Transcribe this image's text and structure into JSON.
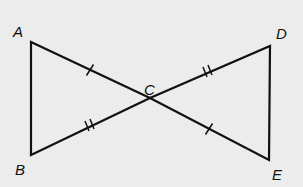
{
  "points": {
    "A": {
      "label": "A",
      "x": 31,
      "y": 42
    },
    "B": {
      "label": "B",
      "x": 31,
      "y": 155
    },
    "C": {
      "label": "C",
      "x": 150,
      "y": 98
    },
    "D": {
      "label": "D",
      "x": 270,
      "y": 46
    },
    "E": {
      "label": "E",
      "x": 269,
      "y": 160
    }
  },
  "segments": [
    {
      "from": "A",
      "to": "B",
      "ticks": 0
    },
    {
      "from": "A",
      "to": "C",
      "ticks": 1
    },
    {
      "from": "C",
      "to": "E",
      "ticks": 1
    },
    {
      "from": "B",
      "to": "C",
      "ticks": 2
    },
    {
      "from": "C",
      "to": "D",
      "ticks": 2
    },
    {
      "from": "D",
      "to": "E",
      "ticks": 0
    }
  ],
  "colors": {
    "background": "#ececec",
    "stroke": "#111111"
  }
}
